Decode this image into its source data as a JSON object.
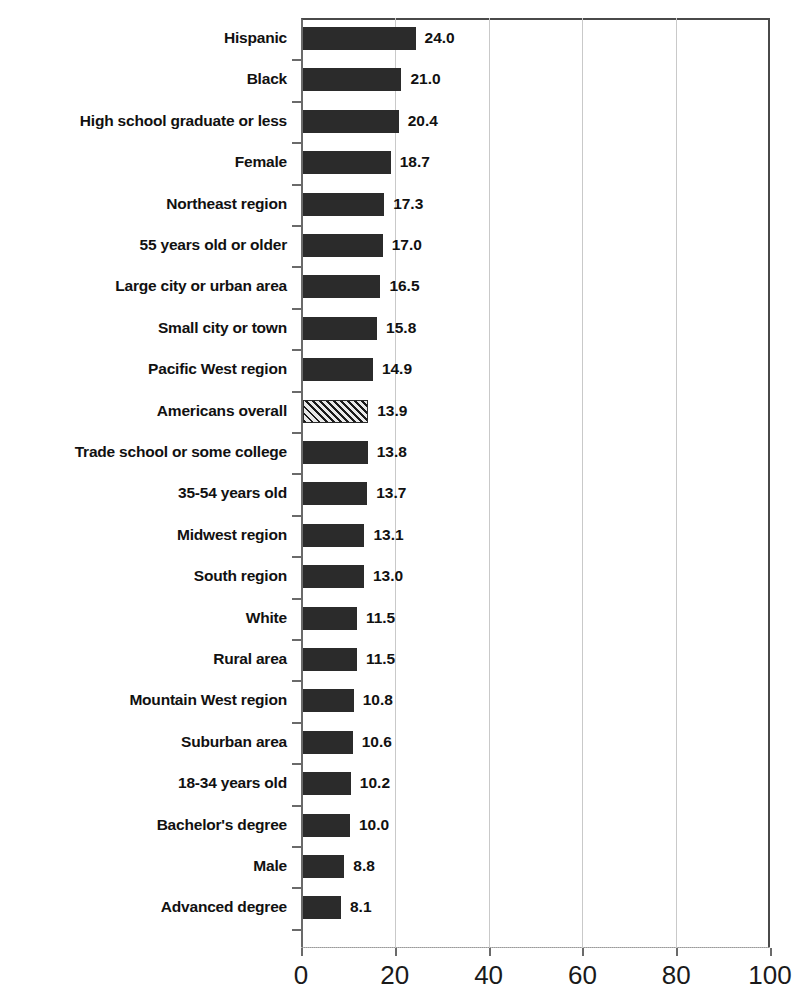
{
  "chart_data": {
    "type": "bar",
    "orientation": "horizontal",
    "title": "",
    "subtitle": "",
    "xlabel": "",
    "ylabel": "",
    "xlim": [
      0,
      100
    ],
    "xticks": [
      0,
      20,
      40,
      60,
      80,
      100
    ],
    "xticklabels": [
      "0",
      "20",
      "40",
      "60",
      "80",
      "100"
    ],
    "grid": "vertical",
    "legend": "none",
    "highlight_category": "Americans overall",
    "highlight_style": "diagonal-hatch",
    "bar_color": "#2b2b2b",
    "highlight_color": "#d9d9d9",
    "gridline_color": "#c9c9c9",
    "axis_color": "#4a4a4a",
    "categories": [
      "Hispanic",
      "Black",
      "High school graduate or less",
      "Female",
      "Northeast region",
      "55 years old or older",
      "Large city or urban area",
      "Small city or town",
      "Pacific West region",
      "Americans overall",
      "Trade school or some college",
      "35-54 years old",
      "Midwest region",
      "South region",
      "White",
      "Rural area",
      "Mountain West region",
      "Suburban area",
      "18-34 years old",
      "Bachelor's degree",
      "Male",
      "Advanced degree"
    ],
    "values": [
      24.0,
      21.0,
      20.4,
      18.7,
      17.3,
      17.0,
      16.5,
      15.8,
      14.9,
      13.9,
      13.8,
      13.7,
      13.1,
      13.0,
      11.5,
      11.5,
      10.8,
      10.6,
      10.2,
      10.0,
      8.8,
      8.1
    ],
    "value_labels": [
      "24.0",
      "21.0",
      "20.4",
      "18.7",
      "17.3",
      "17.0",
      "16.5",
      "15.8",
      "14.9",
      "13.9",
      "13.8",
      "13.7",
      "13.1",
      "13.0",
      "11.5",
      "11.5",
      "10.8",
      "10.6",
      "10.2",
      "10.0",
      "8.8",
      "8.1"
    ]
  }
}
